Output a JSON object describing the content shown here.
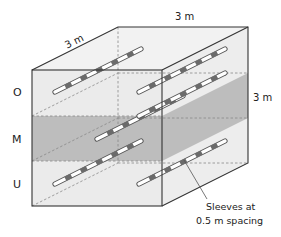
{
  "diagram": {
    "dimensions": {
      "depth_label": "3 m",
      "width_label": "3 m",
      "height_label": "3 m"
    },
    "layers": [
      {
        "id": "O",
        "label": "O",
        "shaded": false
      },
      {
        "id": "M",
        "label": "M",
        "shaded": true
      },
      {
        "id": "U",
        "label": "U",
        "shaded": false
      }
    ],
    "annotation": {
      "line1": "Sleeves at",
      "line2": "0.5 m spacing"
    },
    "pipes": [
      {
        "layer": "O",
        "column": "left"
      },
      {
        "layer": "O",
        "column": "right"
      },
      {
        "layer": "M",
        "column": "left"
      },
      {
        "layer": "M",
        "column": "right"
      },
      {
        "layer": "U",
        "column": "left"
      },
      {
        "layer": "U",
        "column": "right"
      }
    ],
    "colors": {
      "face_light": "#ececec",
      "face_top": "#f2f2f2",
      "band_shade": "#bdbdbd",
      "edge": "#333333",
      "hidden_edge": "#888888",
      "sleeve": "#6b6b6b",
      "pipe": "#ffffff"
    }
  }
}
